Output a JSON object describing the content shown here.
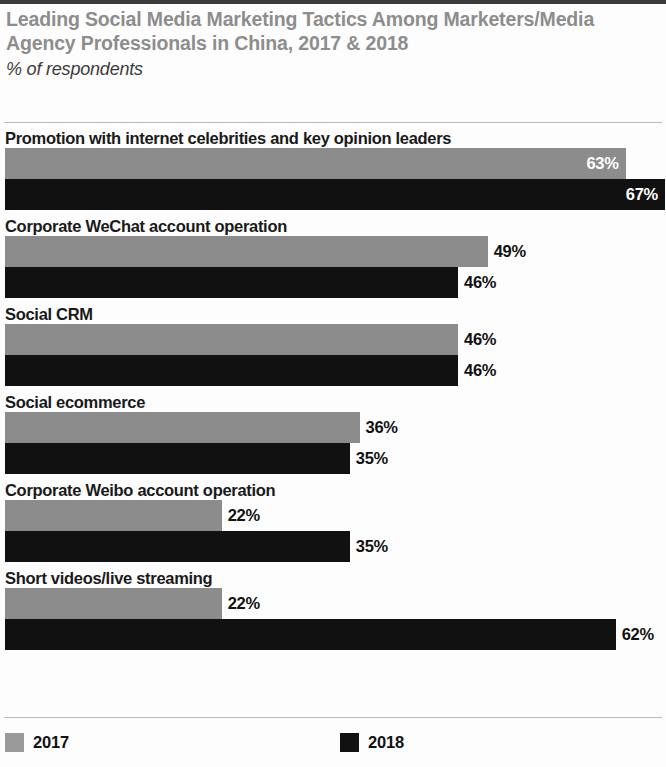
{
  "chart_data": {
    "type": "bar",
    "orientation": "horizontal",
    "title": "Leading Social Media Marketing Tactics Among Marketers/Media Agency Professionals in China, 2017 & 2018",
    "subtitle": "% of respondents",
    "xlabel": "",
    "ylabel": "",
    "xlim": [
      0,
      67
    ],
    "grid": false,
    "legend_position": "bottom",
    "value_suffix": "%",
    "categories": [
      "Promotion with internet celebrities and key opinion leaders",
      "Corporate WeChat account operation",
      "Social CRM",
      "Social ecommerce",
      "Corporate Weibo account operation",
      "Short videos/live streaming"
    ],
    "series": [
      {
        "name": "2017",
        "color": "#8c8c8c",
        "values": [
          63,
          49,
          46,
          36,
          22,
          22
        ],
        "labels": [
          "63%",
          "49%",
          "46%",
          "36%",
          "22%",
          "22%"
        ]
      },
      {
        "name": "2018",
        "color": "#111111",
        "values": [
          67,
          46,
          46,
          35,
          35,
          62
        ],
        "labels": [
          "67%",
          "46%",
          "46%",
          "35%",
          "35%",
          "62%"
        ]
      }
    ],
    "groups": [
      {
        "category": "Promotion with internet celebrities and key opinion leaders",
        "bars": [
          {
            "series": "2017",
            "value": 63,
            "label": "63%",
            "label_placement": "inside"
          },
          {
            "series": "2018",
            "value": 67,
            "label": "67%",
            "label_placement": "inside"
          }
        ]
      },
      {
        "category": "Corporate WeChat account operation",
        "bars": [
          {
            "series": "2017",
            "value": 49,
            "label": "49%",
            "label_placement": "outside"
          },
          {
            "series": "2018",
            "value": 46,
            "label": "46%",
            "label_placement": "outside"
          }
        ]
      },
      {
        "category": "Social CRM",
        "bars": [
          {
            "series": "2017",
            "value": 46,
            "label": "46%",
            "label_placement": "outside"
          },
          {
            "series": "2018",
            "value": 46,
            "label": "46%",
            "label_placement": "outside"
          }
        ]
      },
      {
        "category": "Social ecommerce",
        "bars": [
          {
            "series": "2017",
            "value": 36,
            "label": "36%",
            "label_placement": "outside"
          },
          {
            "series": "2018",
            "value": 35,
            "label": "35%",
            "label_placement": "outside"
          }
        ]
      },
      {
        "category": "Corporate Weibo account operation",
        "bars": [
          {
            "series": "2017",
            "value": 22,
            "label": "22%",
            "label_placement": "outside"
          },
          {
            "series": "2018",
            "value": 35,
            "label": "35%",
            "label_placement": "outside"
          }
        ]
      },
      {
        "category": "Short videos/live streaming",
        "bars": [
          {
            "series": "2017",
            "value": 22,
            "label": "22%",
            "label_placement": "outside"
          },
          {
            "series": "2018",
            "value": 62,
            "label": "62%",
            "label_placement": "outside"
          }
        ]
      }
    ],
    "legend": [
      {
        "label": "2017",
        "color": "#8c8c8c"
      },
      {
        "label": "2018",
        "color": "#111111"
      }
    ]
  },
  "colors": {
    "series_2017": "#8c8c8c",
    "series_2018": "#111111",
    "title_gray": "#8d8d8d",
    "text_black": "#1a1a1a",
    "rule_gray": "#b9b9b9",
    "top_rule": "#3b3b3b"
  }
}
